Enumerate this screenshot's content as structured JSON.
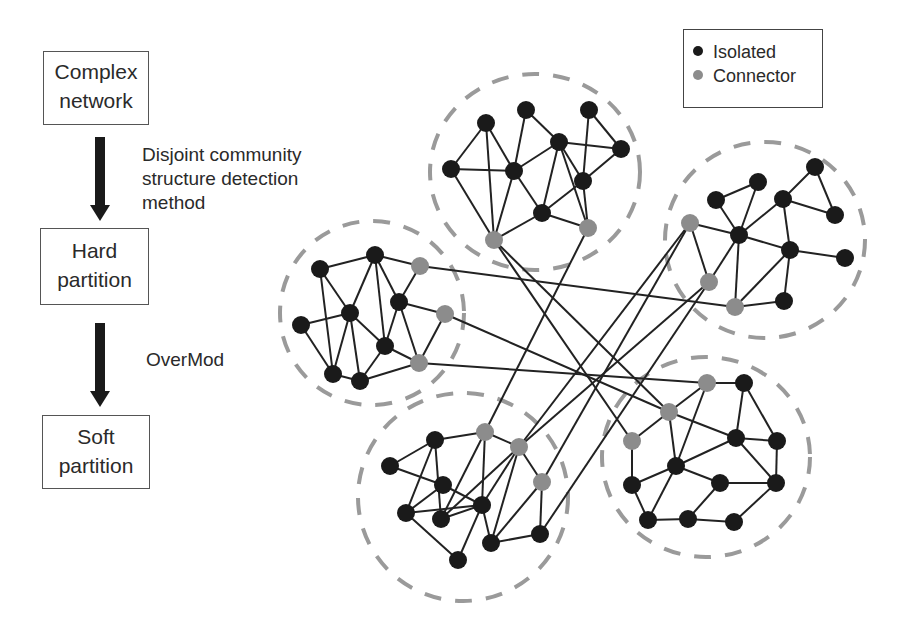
{
  "flowchart": {
    "steps": [
      {
        "lines": [
          "Complex",
          "network"
        ]
      },
      {
        "lines": [
          "Hard",
          "partition"
        ]
      },
      {
        "lines": [
          "Soft",
          "partition"
        ]
      }
    ],
    "transitions": [
      {
        "lines": [
          "Disjoint community",
          "structure detection",
          "method"
        ]
      },
      {
        "lines": [
          "OverMod"
        ]
      }
    ]
  },
  "legend": {
    "items": [
      {
        "label": "Isolated",
        "color": "#1a1a1a"
      },
      {
        "label": "Connector",
        "color": "#8c8c8c"
      }
    ]
  },
  "network": {
    "colors": {
      "isolated": "#1a1a1a",
      "connector": "#8c8c8c",
      "edge": "#222222",
      "community_border": "#9a9a9a"
    },
    "communities": [
      {
        "name": "top",
        "cx": 535,
        "cy": 172,
        "rx": 105,
        "ry": 98
      },
      {
        "name": "left",
        "cx": 372,
        "cy": 313,
        "rx": 92,
        "ry": 92
      },
      {
        "name": "right",
        "cx": 765,
        "cy": 240,
        "rx": 100,
        "ry": 98
      },
      {
        "name": "bottom-left",
        "cx": 463,
        "cy": 497,
        "rx": 105,
        "ry": 104
      },
      {
        "name": "bottom-right",
        "cx": 706,
        "cy": 457,
        "rx": 104,
        "ry": 100
      }
    ],
    "nodes": [
      {
        "id": "A",
        "x": 486,
        "y": 123,
        "type": "isolated"
      },
      {
        "id": "B",
        "x": 526,
        "y": 110,
        "type": "isolated"
      },
      {
        "id": "C",
        "x": 589,
        "y": 110,
        "type": "isolated"
      },
      {
        "id": "D",
        "x": 451,
        "y": 169,
        "type": "isolated"
      },
      {
        "id": "E",
        "x": 514,
        "y": 171,
        "type": "isolated"
      },
      {
        "id": "F",
        "x": 559,
        "y": 142,
        "type": "isolated"
      },
      {
        "id": "G",
        "x": 621,
        "y": 149,
        "type": "isolated"
      },
      {
        "id": "H",
        "x": 583,
        "y": 181,
        "type": "isolated"
      },
      {
        "id": "I",
        "x": 542,
        "y": 213,
        "type": "isolated"
      },
      {
        "id": "J",
        "x": 494,
        "y": 240,
        "type": "connector"
      },
      {
        "id": "K",
        "x": 588,
        "y": 228,
        "type": "connector"
      },
      {
        "id": "a",
        "x": 320,
        "y": 269,
        "type": "isolated"
      },
      {
        "id": "b",
        "x": 375,
        "y": 255,
        "type": "isolated"
      },
      {
        "id": "c",
        "x": 420,
        "y": 266,
        "type": "connector"
      },
      {
        "id": "d",
        "x": 301,
        "y": 325,
        "type": "isolated"
      },
      {
        "id": "e",
        "x": 350,
        "y": 313,
        "type": "isolated"
      },
      {
        "id": "f",
        "x": 399,
        "y": 302,
        "type": "isolated"
      },
      {
        "id": "g",
        "x": 445,
        "y": 314,
        "type": "connector"
      },
      {
        "id": "h",
        "x": 385,
        "y": 346,
        "type": "isolated"
      },
      {
        "id": "i",
        "x": 333,
        "y": 374,
        "type": "isolated"
      },
      {
        "id": "j",
        "x": 360,
        "y": 381,
        "type": "isolated"
      },
      {
        "id": "k",
        "x": 419,
        "y": 363,
        "type": "connector"
      },
      {
        "id": "p",
        "x": 716,
        "y": 200,
        "type": "isolated"
      },
      {
        "id": "q",
        "x": 758,
        "y": 182,
        "type": "isolated"
      },
      {
        "id": "r",
        "x": 783,
        "y": 199,
        "type": "isolated"
      },
      {
        "id": "s",
        "x": 815,
        "y": 167,
        "type": "isolated"
      },
      {
        "id": "t",
        "x": 835,
        "y": 215,
        "type": "isolated"
      },
      {
        "id": "u",
        "x": 690,
        "y": 223,
        "type": "connector"
      },
      {
        "id": "v",
        "x": 739,
        "y": 235,
        "type": "isolated"
      },
      {
        "id": "w",
        "x": 790,
        "y": 250,
        "type": "isolated"
      },
      {
        "id": "x",
        "x": 845,
        "y": 258,
        "type": "isolated"
      },
      {
        "id": "y",
        "x": 709,
        "y": 282,
        "type": "connector"
      },
      {
        "id": "z",
        "x": 735,
        "y": 307,
        "type": "connector"
      },
      {
        "id": "aa",
        "x": 784,
        "y": 301,
        "type": "isolated"
      },
      {
        "id": "b1",
        "x": 390,
        "y": 466,
        "type": "isolated"
      },
      {
        "id": "b2",
        "x": 435,
        "y": 440,
        "type": "isolated"
      },
      {
        "id": "b3",
        "x": 485,
        "y": 432,
        "type": "connector"
      },
      {
        "id": "b4",
        "x": 519,
        "y": 447,
        "type": "connector"
      },
      {
        "id": "b5",
        "x": 443,
        "y": 485,
        "type": "isolated"
      },
      {
        "id": "b6",
        "x": 406,
        "y": 513,
        "type": "isolated"
      },
      {
        "id": "b7",
        "x": 441,
        "y": 519,
        "type": "isolated"
      },
      {
        "id": "b8",
        "x": 482,
        "y": 505,
        "type": "isolated"
      },
      {
        "id": "b9",
        "x": 542,
        "y": 482,
        "type": "connector"
      },
      {
        "id": "b10",
        "x": 458,
        "y": 560,
        "type": "isolated"
      },
      {
        "id": "b11",
        "x": 491,
        "y": 543,
        "type": "isolated"
      },
      {
        "id": "b12",
        "x": 540,
        "y": 534,
        "type": "isolated"
      },
      {
        "id": "r1",
        "x": 707,
        "y": 383,
        "type": "connector"
      },
      {
        "id": "r2",
        "x": 744,
        "y": 383,
        "type": "isolated"
      },
      {
        "id": "r3",
        "x": 669,
        "y": 412,
        "type": "connector"
      },
      {
        "id": "r4",
        "x": 632,
        "y": 441,
        "type": "connector"
      },
      {
        "id": "r5",
        "x": 736,
        "y": 438,
        "type": "isolated"
      },
      {
        "id": "r6",
        "x": 777,
        "y": 441,
        "type": "isolated"
      },
      {
        "id": "r7",
        "x": 676,
        "y": 466,
        "type": "isolated"
      },
      {
        "id": "r8",
        "x": 632,
        "y": 485,
        "type": "isolated"
      },
      {
        "id": "r9",
        "x": 720,
        "y": 483,
        "type": "isolated"
      },
      {
        "id": "r10",
        "x": 776,
        "y": 483,
        "type": "isolated"
      },
      {
        "id": "r11",
        "x": 648,
        "y": 520,
        "type": "isolated"
      },
      {
        "id": "r12",
        "x": 688,
        "y": 519,
        "type": "isolated"
      },
      {
        "id": "r13",
        "x": 734,
        "y": 522,
        "type": "isolated"
      }
    ],
    "edges": [
      [
        "A",
        "D"
      ],
      [
        "A",
        "J"
      ],
      [
        "A",
        "E"
      ],
      [
        "D",
        "E"
      ],
      [
        "D",
        "J"
      ],
      [
        "B",
        "E"
      ],
      [
        "B",
        "F"
      ],
      [
        "E",
        "F"
      ],
      [
        "E",
        "J"
      ],
      [
        "E",
        "I"
      ],
      [
        "F",
        "G"
      ],
      [
        "F",
        "I"
      ],
      [
        "F",
        "H"
      ],
      [
        "F",
        "K"
      ],
      [
        "C",
        "H"
      ],
      [
        "C",
        "G"
      ],
      [
        "G",
        "H"
      ],
      [
        "H",
        "I"
      ],
      [
        "H",
        "K"
      ],
      [
        "I",
        "J"
      ],
      [
        "I",
        "K"
      ],
      [
        "a",
        "b"
      ],
      [
        "a",
        "e"
      ],
      [
        "a",
        "i"
      ],
      [
        "b",
        "c"
      ],
      [
        "b",
        "e"
      ],
      [
        "b",
        "f"
      ],
      [
        "b",
        "h"
      ],
      [
        "c",
        "f"
      ],
      [
        "d",
        "e"
      ],
      [
        "d",
        "i"
      ],
      [
        "e",
        "i"
      ],
      [
        "e",
        "j"
      ],
      [
        "e",
        "h"
      ],
      [
        "f",
        "g"
      ],
      [
        "f",
        "h"
      ],
      [
        "f",
        "k"
      ],
      [
        "g",
        "k"
      ],
      [
        "h",
        "j"
      ],
      [
        "h",
        "k"
      ],
      [
        "i",
        "j"
      ],
      [
        "j",
        "k"
      ],
      [
        "p",
        "q"
      ],
      [
        "p",
        "v"
      ],
      [
        "q",
        "v"
      ],
      [
        "r",
        "s"
      ],
      [
        "r",
        "v"
      ],
      [
        "r",
        "w"
      ],
      [
        "s",
        "t"
      ],
      [
        "r",
        "t"
      ],
      [
        "u",
        "v"
      ],
      [
        "u",
        "y"
      ],
      [
        "v",
        "w"
      ],
      [
        "v",
        "y"
      ],
      [
        "v",
        "z"
      ],
      [
        "w",
        "x"
      ],
      [
        "w",
        "z"
      ],
      [
        "w",
        "aa"
      ],
      [
        "z",
        "aa"
      ],
      [
        "b1",
        "b2"
      ],
      [
        "b1",
        "b5"
      ],
      [
        "b2",
        "b3"
      ],
      [
        "b2",
        "b6"
      ],
      [
        "b2",
        "b7"
      ],
      [
        "b3",
        "b7"
      ],
      [
        "b3",
        "b8"
      ],
      [
        "b4",
        "b7"
      ],
      [
        "b4",
        "b8"
      ],
      [
        "b4",
        "b9"
      ],
      [
        "b4",
        "b11"
      ],
      [
        "b3",
        "b4"
      ],
      [
        "b5",
        "b6"
      ],
      [
        "b5",
        "b8"
      ],
      [
        "b6",
        "b10"
      ],
      [
        "b7",
        "b8"
      ],
      [
        "b8",
        "b10"
      ],
      [
        "b8",
        "b11"
      ],
      [
        "b9",
        "b11"
      ],
      [
        "b9",
        "b12"
      ],
      [
        "b11",
        "b12"
      ],
      [
        "b6",
        "b8"
      ],
      [
        "r1",
        "r2"
      ],
      [
        "r1",
        "r3"
      ],
      [
        "r1",
        "r7"
      ],
      [
        "r2",
        "r5"
      ],
      [
        "r2",
        "r6"
      ],
      [
        "r3",
        "r4"
      ],
      [
        "r3",
        "r5"
      ],
      [
        "r3",
        "r7"
      ],
      [
        "r4",
        "r8"
      ],
      [
        "r5",
        "r6"
      ],
      [
        "r5",
        "r7"
      ],
      [
        "r5",
        "r10"
      ],
      [
        "r6",
        "r10"
      ],
      [
        "r7",
        "r8"
      ],
      [
        "r7",
        "r9"
      ],
      [
        "r7",
        "r11"
      ],
      [
        "r8",
        "r11"
      ],
      [
        "r9",
        "r10"
      ],
      [
        "r9",
        "r12"
      ],
      [
        "r10",
        "r13"
      ],
      [
        "r11",
        "r12"
      ],
      [
        "r12",
        "r13"
      ],
      [
        "c",
        "z"
      ],
      [
        "g",
        "r3"
      ],
      [
        "k",
        "r1"
      ],
      [
        "J",
        "r4"
      ],
      [
        "J",
        "r3"
      ],
      [
        "K",
        "b3"
      ],
      [
        "u",
        "b4"
      ],
      [
        "u",
        "b9"
      ],
      [
        "y",
        "b12"
      ],
      [
        "y",
        "b4"
      ]
    ]
  }
}
